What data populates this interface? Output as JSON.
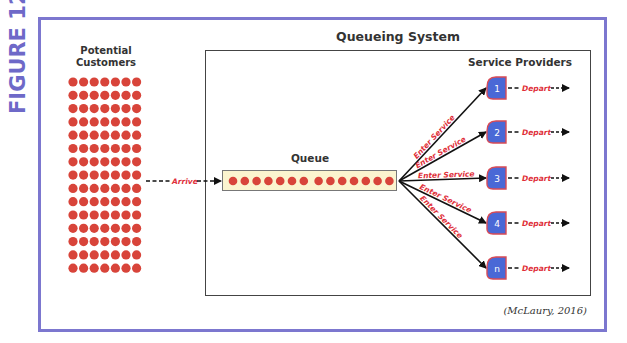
{
  "figure": {
    "label": "FIGURE 12.3",
    "citation": "(McLaury, 2016)",
    "colors": {
      "frame": "#7c77cf",
      "figure_label": "#6e69c8",
      "customer_dot": "#d8443a",
      "queue_fill": "#fbf4cf",
      "server_fill": "#4a68d6",
      "server_border": "#d84a55",
      "flow_label": "#e0303a",
      "arrow": "#111111"
    }
  },
  "customers": {
    "title_line1": "Potential",
    "title_line2": "Customers",
    "grid_columns": 7,
    "grid_rows": 15
  },
  "arrive": {
    "label": "Arrive"
  },
  "system": {
    "title": "Queueing System",
    "queue": {
      "title": "Queue",
      "dots_group1": 7,
      "dots_group2": 7
    },
    "providers": {
      "title": "Service Providers",
      "servers": [
        {
          "id": "1",
          "enter_label": "Enter Service",
          "depart_label": "Depart"
        },
        {
          "id": "2",
          "enter_label": "Enter Service",
          "depart_label": "Depart"
        },
        {
          "id": "3",
          "enter_label": "Enter Service",
          "depart_label": "Depart"
        },
        {
          "id": "4",
          "enter_label": "Enter Service",
          "depart_label": "Depart"
        },
        {
          "id": "n",
          "enter_label": "Enter Service",
          "depart_label": "Depart"
        }
      ]
    }
  }
}
